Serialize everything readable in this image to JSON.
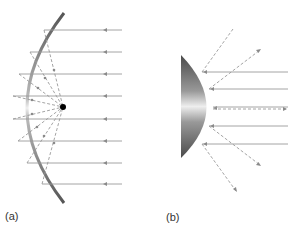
{
  "panels": [
    {
      "id": "a",
      "label": "(a)",
      "mirror_type": "concave",
      "incident_ray_y": [
        30,
        52,
        74,
        96,
        119,
        141,
        163,
        184
      ],
      "mirror_hit_x": [
        44,
        30,
        19,
        13,
        13,
        18,
        27,
        42
      ],
      "focus": {
        "x": 63,
        "y": 107
      },
      "ray_end_x": 122
    },
    {
      "id": "b",
      "label": "(b)",
      "mirror_type": "convex",
      "incident_ray_y": [
        72,
        89,
        108,
        126,
        144
      ],
      "ray_end_x": 288
    }
  ],
  "colors": {
    "ray": "#9a9a9a",
    "arrow": "#8a8a8a",
    "mirror_dark": "#555555",
    "mirror_light": "#e8e8e8",
    "focus_dot": "#000000",
    "label": "#333333"
  }
}
